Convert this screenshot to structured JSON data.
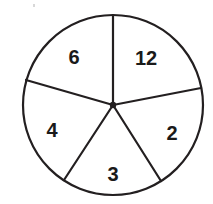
{
  "figure": {
    "name": "pie-chart-five-sectors",
    "background_color": "#ffffff",
    "stroke_color": "#231f20",
    "label_color": "#1a1a1a",
    "circle": {
      "center_x": 113,
      "center_y": 105,
      "radius": 90,
      "stroke_width": 2.2
    },
    "center_dot": {
      "radius": 3.2
    },
    "speck": {
      "x": 33,
      "y": 4
    }
  },
  "chart_data": {
    "type": "pie",
    "title": "",
    "xlabel": "",
    "ylabel": "",
    "legend": "none",
    "grid": false,
    "categories": [
      "12",
      "2",
      "3",
      "4",
      "6"
    ],
    "values": [
      12,
      2,
      3,
      4,
      6
    ],
    "labels": [
      "12",
      "2",
      "3",
      "4",
      "6"
    ],
    "sectors": [
      {
        "label": "12",
        "value": 12,
        "start_angle_deg": 90,
        "end_angle_deg": 11,
        "label_x": 146,
        "label_y": 58
      },
      {
        "label": "2",
        "value": 2,
        "start_angle_deg": 11,
        "end_angle_deg": -58,
        "label_x": 172,
        "label_y": 133
      },
      {
        "label": "3",
        "value": 3,
        "start_angle_deg": -58,
        "end_angle_deg": -123,
        "label_x": 113,
        "label_y": 174
      },
      {
        "label": "4",
        "value": 4,
        "start_angle_deg": -123,
        "end_angle_deg": 164,
        "label_x": 52,
        "label_y": 130
      },
      {
        "label": "6",
        "value": 6,
        "start_angle_deg": 164,
        "end_angle_deg": 90,
        "label_x": 74,
        "label_y": 57
      }
    ],
    "radii": [
      {
        "name": "radius-up",
        "angle_deg": 90,
        "end_x": 113,
        "end_y": 15
      },
      {
        "name": "radius-upper-right",
        "angle_deg": 11,
        "end_x": 201,
        "end_y": 88
      },
      {
        "name": "radius-lower-right",
        "angle_deg": -58,
        "end_x": 161,
        "end_y": 181
      },
      {
        "name": "radius-lower-left",
        "angle_deg": -123,
        "end_x": 64,
        "end_y": 180
      },
      {
        "name": "radius-upper-left",
        "angle_deg": 164,
        "end_x": 26,
        "end_y": 80
      }
    ]
  }
}
